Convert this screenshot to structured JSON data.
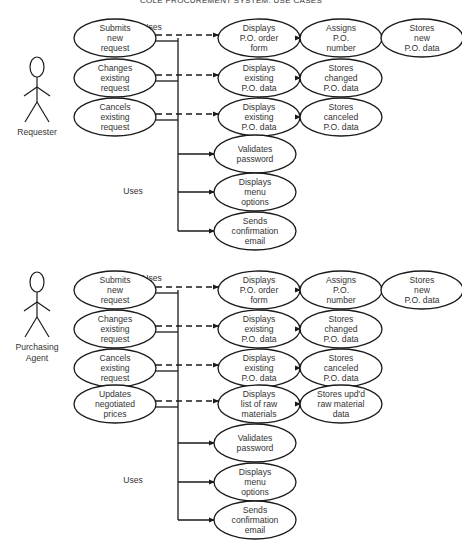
{
  "title": "COLE PROCUREMENT SYSTEM: USE CASES",
  "sections": [
    {
      "actor": {
        "label": [
          "Requester"
        ],
        "x": 37,
        "y": 100
      },
      "uses_top": {
        "label": "Uses",
        "x": 152,
        "y": 30
      },
      "uses_mid": {
        "label": "Uses",
        "x": 133,
        "y": 194
      },
      "trunk_x": 178,
      "primary": [
        {
          "id": "submits",
          "lines": [
            "Submits",
            "new",
            "request"
          ],
          "cx": 115,
          "cy": 38,
          "chain": [
            {
              "lines": [
                "Displays",
                "P.O. order",
                "form"
              ],
              "cx": 259,
              "cy": 38
            },
            {
              "lines": [
                "Assigns",
                "P.O.",
                "number"
              ],
              "cx": 341,
              "cy": 38
            },
            {
              "lines": [
                "Stores",
                "new",
                "P.O. data"
              ],
              "cx": 422,
              "cy": 38
            }
          ]
        },
        {
          "id": "changes",
          "lines": [
            "Changes",
            "existing",
            "request"
          ],
          "cx": 115,
          "cy": 78,
          "chain": [
            {
              "lines": [
                "Displays",
                "existing",
                "P.O. data"
              ],
              "cx": 259,
              "cy": 78
            },
            {
              "lines": [
                "Stores",
                "changed",
                "P.O. data"
              ],
              "cx": 341,
              "cy": 78
            }
          ]
        },
        {
          "id": "cancels",
          "lines": [
            "Cancels",
            "existing",
            "request"
          ],
          "cx": 115,
          "cy": 117,
          "chain": [
            {
              "lines": [
                "Displays",
                "existing",
                "P.O. data"
              ],
              "cx": 259,
              "cy": 117
            },
            {
              "lines": [
                "Stores",
                "canceled",
                "P.O. data"
              ],
              "cx": 341,
              "cy": 117
            }
          ]
        }
      ],
      "shared": [
        {
          "lines": [
            "Validates",
            "password"
          ],
          "cx": 255,
          "cy": 154
        },
        {
          "lines": [
            "Displays",
            "menu",
            "options"
          ],
          "cx": 255,
          "cy": 192
        },
        {
          "lines": [
            "Sends",
            "confirmation",
            "email"
          ],
          "cx": 255,
          "cy": 231
        }
      ]
    },
    {
      "actor": {
        "label": [
          "Purchasing",
          "Agent"
        ],
        "x": 37,
        "y": 315
      },
      "uses_top": {
        "label": "Uses",
        "x": 152,
        "y": 281
      },
      "uses_mid": {
        "label": "Uses",
        "x": 133,
        "y": 483
      },
      "trunk_x": 178,
      "primary": [
        {
          "id": "submits",
          "lines": [
            "Submits",
            "new",
            "request"
          ],
          "cx": 115,
          "cy": 290,
          "chain": [
            {
              "lines": [
                "Displays",
                "P.O. order",
                "form"
              ],
              "cx": 259,
              "cy": 290
            },
            {
              "lines": [
                "Assigns",
                "P.O.",
                "number"
              ],
              "cx": 341,
              "cy": 290
            },
            {
              "lines": [
                "Stores",
                "new",
                "P.O. data"
              ],
              "cx": 422,
              "cy": 290
            }
          ]
        },
        {
          "id": "changes",
          "lines": [
            "Changes",
            "existing",
            "request"
          ],
          "cx": 115,
          "cy": 329,
          "chain": [
            {
              "lines": [
                "Displays",
                "existing",
                "P.O. data"
              ],
              "cx": 259,
              "cy": 329
            },
            {
              "lines": [
                "Stores",
                "changed",
                "P.O. data"
              ],
              "cx": 341,
              "cy": 329
            }
          ]
        },
        {
          "id": "cancels",
          "lines": [
            "Cancels",
            "existing",
            "request"
          ],
          "cx": 115,
          "cy": 368,
          "chain": [
            {
              "lines": [
                "Displays",
                "existing",
                "P.O. data"
              ],
              "cx": 259,
              "cy": 368
            },
            {
              "lines": [
                "Stores",
                "canceled",
                "P.O. data"
              ],
              "cx": 341,
              "cy": 368
            }
          ]
        },
        {
          "id": "updates",
          "lines": [
            "Updates",
            "negotiated",
            "prices"
          ],
          "cx": 115,
          "cy": 404,
          "chain": [
            {
              "lines": [
                "Displays",
                "list of raw",
                "materials"
              ],
              "cx": 259,
              "cy": 404
            },
            {
              "lines": [
                "Stores upd'd",
                "raw material",
                "data"
              ],
              "cx": 341,
              "cy": 404
            }
          ]
        }
      ],
      "shared": [
        {
          "lines": [
            "Validates",
            "password"
          ],
          "cx": 255,
          "cy": 443
        },
        {
          "lines": [
            "Displays",
            "menu",
            "options"
          ],
          "cx": 255,
          "cy": 482
        },
        {
          "lines": [
            "Sends",
            "confirmation",
            "email"
          ],
          "cx": 255,
          "cy": 520
        }
      ]
    }
  ],
  "colors": {
    "stroke": "#1a1a1a",
    "text": "#333333"
  }
}
